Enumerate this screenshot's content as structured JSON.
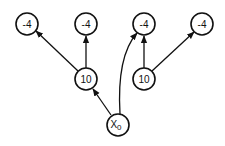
{
  "diagram": {
    "type": "tree",
    "nodes": [
      {
        "id": "n1",
        "label": "-4",
        "x": 27,
        "y": 24
      },
      {
        "id": "n2",
        "label": "-4",
        "x": 86,
        "y": 24
      },
      {
        "id": "n3",
        "label": "-4",
        "x": 144,
        "y": 24
      },
      {
        "id": "n4",
        "label": "-4",
        "x": 202,
        "y": 24
      },
      {
        "id": "m1",
        "label": "10",
        "x": 86,
        "y": 79
      },
      {
        "id": "m2",
        "label": "10",
        "x": 144,
        "y": 79
      },
      {
        "id": "root",
        "label": "X",
        "subscript": "0",
        "x": 118,
        "y": 125
      }
    ],
    "edges": [
      {
        "from": "root",
        "to": "m1"
      },
      {
        "from": "root",
        "to": "n3",
        "curved": true
      },
      {
        "from": "m1",
        "to": "n1"
      },
      {
        "from": "m1",
        "to": "n2"
      },
      {
        "from": "m2",
        "to": "n3"
      },
      {
        "from": "m2",
        "to": "n4"
      }
    ]
  }
}
